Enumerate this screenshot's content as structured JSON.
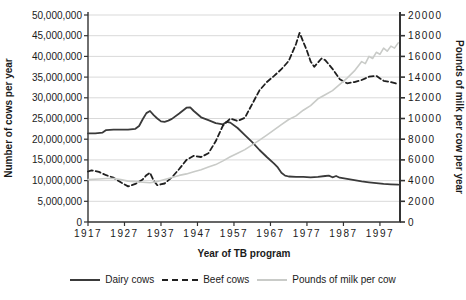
{
  "chart_data": {
    "type": "line",
    "title": "",
    "xlabel": "Year of TB program",
    "ylabel_left": "Number of cows per year",
    "ylabel_right": "Pounds of milk per cow per year",
    "grid": true,
    "legend_position": "bottom",
    "x_range": [
      1917,
      2002.5
    ],
    "x_ticks": [
      1917,
      1927,
      1937,
      1947,
      1957,
      1967,
      1977,
      1987,
      1997
    ],
    "x_tick_labels": [
      "1917",
      "1927",
      "1937",
      "1947",
      "1957",
      "1967",
      "1977",
      "1987",
      "1997"
    ],
    "left_axis": {
      "min": 0,
      "max": 50000000,
      "tick_labels_top_to_bottom": [
        "50,000,000",
        "45,000,000",
        "40,000,000",
        "35,000,000",
        "30,000,000",
        "25,000,000",
        "20,000,000",
        "15,000,000",
        "10,000,000",
        "5,000,000",
        "0"
      ]
    },
    "right_axis": {
      "min": 0,
      "max": 20000,
      "tick_labels_top_to_bottom": [
        "20000",
        "18000",
        "16000",
        "14000",
        "12000",
        "10000",
        "8000",
        "6000",
        "4000",
        "2000",
        "0"
      ]
    },
    "colors": {
      "grid": "#d9d9d9",
      "axis": "#333333",
      "text": "#1a1a1a",
      "dairy": "#3a3a3a",
      "beef": "#1f1f1f",
      "milk": "#c9cbc8"
    },
    "series": [
      {
        "name": "Dairy cows",
        "axis": "left",
        "style": "solid",
        "color": "#3a3a3a",
        "points": [
          [
            1917,
            21400000
          ],
          [
            1919,
            21400000
          ],
          [
            1921,
            21600000
          ],
          [
            1922,
            22200000
          ],
          [
            1924,
            22300000
          ],
          [
            1926,
            22300000
          ],
          [
            1928,
            22300000
          ],
          [
            1930,
            22500000
          ],
          [
            1931,
            23200000
          ],
          [
            1932,
            24800000
          ],
          [
            1933,
            26300000
          ],
          [
            1934,
            26800000
          ],
          [
            1935,
            25800000
          ],
          [
            1936,
            25000000
          ],
          [
            1937,
            24300000
          ],
          [
            1938,
            24200000
          ],
          [
            1939,
            24500000
          ],
          [
            1940,
            24900000
          ],
          [
            1942,
            26200000
          ],
          [
            1944,
            27600000
          ],
          [
            1945,
            27700000
          ],
          [
            1946,
            26800000
          ],
          [
            1948,
            25300000
          ],
          [
            1950,
            24600000
          ],
          [
            1952,
            23900000
          ],
          [
            1954,
            23600000
          ],
          [
            1955,
            24200000
          ],
          [
            1956,
            24000000
          ],
          [
            1958,
            22700000
          ],
          [
            1960,
            21000000
          ],
          [
            1962,
            19300000
          ],
          [
            1964,
            17400000
          ],
          [
            1966,
            15700000
          ],
          [
            1968,
            14100000
          ],
          [
            1969,
            13200000
          ],
          [
            1970,
            11900000
          ],
          [
            1971,
            11200000
          ],
          [
            1972,
            11000000
          ],
          [
            1974,
            10900000
          ],
          [
            1976,
            10900000
          ],
          [
            1978,
            10800000
          ],
          [
            1980,
            10900000
          ],
          [
            1982,
            11100000
          ],
          [
            1983,
            11200000
          ],
          [
            1984,
            10800000
          ],
          [
            1985,
            11100000
          ],
          [
            1986,
            10700000
          ],
          [
            1988,
            10400000
          ],
          [
            1990,
            10100000
          ],
          [
            1992,
            9800000
          ],
          [
            1994,
            9600000
          ],
          [
            1996,
            9400000
          ],
          [
            1998,
            9200000
          ],
          [
            2000,
            9100000
          ],
          [
            2002,
            9000000
          ]
        ]
      },
      {
        "name": "Beef cows",
        "axis": "left",
        "style": "dashed",
        "color": "#1f1f1f",
        "points": [
          [
            1917,
            12200000
          ],
          [
            1918,
            12500000
          ],
          [
            1920,
            12100000
          ],
          [
            1922,
            11300000
          ],
          [
            1924,
            10700000
          ],
          [
            1926,
            9600000
          ],
          [
            1928,
            8600000
          ],
          [
            1930,
            9200000
          ],
          [
            1932,
            10300000
          ],
          [
            1933,
            11300000
          ],
          [
            1934,
            11900000
          ],
          [
            1935,
            10000000
          ],
          [
            1936,
            8900000
          ],
          [
            1938,
            9300000
          ],
          [
            1940,
            10800000
          ],
          [
            1942,
            12800000
          ],
          [
            1944,
            15000000
          ],
          [
            1946,
            16000000
          ],
          [
            1948,
            15700000
          ],
          [
            1950,
            16600000
          ],
          [
            1952,
            19500000
          ],
          [
            1954,
            23300000
          ],
          [
            1956,
            25000000
          ],
          [
            1958,
            24400000
          ],
          [
            1960,
            25200000
          ],
          [
            1962,
            28500000
          ],
          [
            1964,
            31800000
          ],
          [
            1966,
            33800000
          ],
          [
            1968,
            35300000
          ],
          [
            1970,
            36900000
          ],
          [
            1972,
            38900000
          ],
          [
            1974,
            43000000
          ],
          [
            1975,
            45700000
          ],
          [
            1976,
            43500000
          ],
          [
            1977,
            41400000
          ],
          [
            1978,
            38800000
          ],
          [
            1979,
            37500000
          ],
          [
            1980,
            38500000
          ],
          [
            1981,
            39500000
          ],
          [
            1982,
            39100000
          ],
          [
            1984,
            37000000
          ],
          [
            1986,
            34500000
          ],
          [
            1988,
            33500000
          ],
          [
            1990,
            33800000
          ],
          [
            1992,
            34300000
          ],
          [
            1994,
            35100000
          ],
          [
            1996,
            35300000
          ],
          [
            1998,
            34100000
          ],
          [
            2000,
            33800000
          ],
          [
            2002,
            33300000
          ]
        ]
      },
      {
        "name": "Pounds of milk per cow",
        "axis": "right",
        "style": "solid",
        "color": "#c9cbc8",
        "points": [
          [
            1917,
            4100
          ],
          [
            1920,
            4150
          ],
          [
            1922,
            4200
          ],
          [
            1924,
            4200
          ],
          [
            1926,
            4100
          ],
          [
            1928,
            3950
          ],
          [
            1930,
            3900
          ],
          [
            1932,
            3850
          ],
          [
            1934,
            3800
          ],
          [
            1936,
            3900
          ],
          [
            1938,
            4100
          ],
          [
            1940,
            4300
          ],
          [
            1942,
            4500
          ],
          [
            1944,
            4650
          ],
          [
            1946,
            4850
          ],
          [
            1948,
            5050
          ],
          [
            1950,
            5300
          ],
          [
            1952,
            5550
          ],
          [
            1954,
            5900
          ],
          [
            1956,
            6300
          ],
          [
            1958,
            6650
          ],
          [
            1960,
            7000
          ],
          [
            1962,
            7450
          ],
          [
            1964,
            7900
          ],
          [
            1966,
            8400
          ],
          [
            1968,
            8900
          ],
          [
            1970,
            9400
          ],
          [
            1972,
            9900
          ],
          [
            1974,
            10250
          ],
          [
            1976,
            10800
          ],
          [
            1978,
            11250
          ],
          [
            1980,
            11900
          ],
          [
            1982,
            12300
          ],
          [
            1984,
            12700
          ],
          [
            1986,
            13300
          ],
          [
            1988,
            13900
          ],
          [
            1990,
            14600
          ],
          [
            1992,
            15500
          ],
          [
            1993,
            15300
          ],
          [
            1994,
            16000
          ],
          [
            1995,
            15800
          ],
          [
            1996,
            16400
          ],
          [
            1997,
            16200
          ],
          [
            1998,
            16800
          ],
          [
            1999,
            16500
          ],
          [
            2000,
            17000
          ],
          [
            2001,
            16800
          ],
          [
            2002,
            17300
          ]
        ]
      }
    ]
  }
}
